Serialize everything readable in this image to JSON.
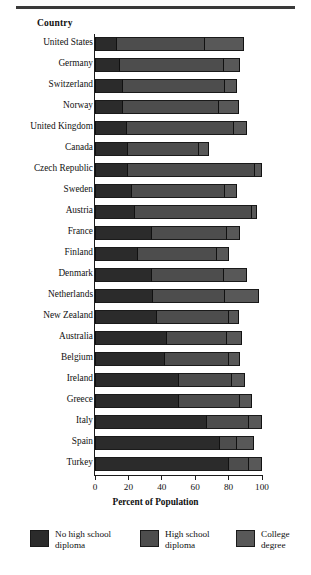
{
  "header": {
    "column_title": "Country"
  },
  "legend": {
    "position": "bottom",
    "items": [
      {
        "label": "No high school\ndiploma",
        "color": "#2b2b2b",
        "left": 30
      },
      {
        "label": "High school\ndiploma",
        "color": "#4d4d4d",
        "left": 140
      },
      {
        "label": "College\ndegree",
        "color": "#585858",
        "left": 236
      }
    ]
  },
  "axis": {
    "title": "Percent of Population",
    "ticks": [
      "0",
      "20",
      "40",
      "60",
      "80",
      "100"
    ]
  },
  "chart_data": {
    "type": "bar",
    "orientation": "horizontal",
    "stacked": true,
    "title": "",
    "xlabel": "Percent of Population",
    "ylabel": "Country",
    "xlim": [
      0,
      100
    ],
    "xticks": [
      0,
      20,
      40,
      60,
      80,
      100
    ],
    "grid": false,
    "legend_position": "bottom",
    "categories": [
      "United States",
      "Germany",
      "Switzerland",
      "Norway",
      "United Kingdom",
      "Canada",
      "Czech Republic",
      "Sweden",
      "Austria",
      "France",
      "Finland",
      "Denmark",
      "Netherlands",
      "New Zealand",
      "Australia",
      "Belgium",
      "Ireland",
      "Greece",
      "Italy",
      "Spain",
      "Turkey"
    ],
    "series": [
      {
        "name": "No high school diploma",
        "color": "#2b2b2b",
        "values": [
          13,
          15,
          17,
          17,
          19,
          20,
          20,
          22,
          24,
          34,
          26,
          34,
          35,
          37,
          43,
          42,
          50,
          50,
          67,
          75,
          80
        ]
      },
      {
        "name": "High school diploma",
        "color": "#4d4d4d",
        "values": [
          53,
          62,
          61,
          57,
          64,
          42,
          76,
          56,
          70,
          45,
          47,
          43,
          43,
          43,
          36,
          38,
          32,
          37,
          25,
          10,
          12
        ]
      },
      {
        "name": "College degree",
        "color": "#585858",
        "values": [
          23,
          10,
          7,
          12,
          8,
          6,
          4,
          7,
          3,
          8,
          7,
          14,
          20,
          6,
          9,
          7,
          8,
          7,
          8,
          10,
          8
        ]
      }
    ]
  }
}
